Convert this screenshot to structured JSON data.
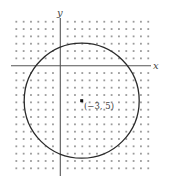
{
  "diagram": {
    "type": "coordinate-plane-circle",
    "axes": {
      "x_label": "x",
      "y_label": "y"
    },
    "grid": {
      "style": "dots",
      "columns_left_of_origin": 6,
      "columns_right_of_origin": 12,
      "rows_above_origin": 6,
      "rows_below_origin": 15
    },
    "circle": {
      "center_label": "(−3, 5)",
      "center_units": {
        "right": 3,
        "down": 5
      },
      "radius_units": 7.8
    },
    "colors": {
      "background": "#ffffff",
      "grid_dot": "#9a9a9a",
      "axis": "#555555",
      "circle": "#2a2a2a",
      "label": "#444444"
    }
  }
}
